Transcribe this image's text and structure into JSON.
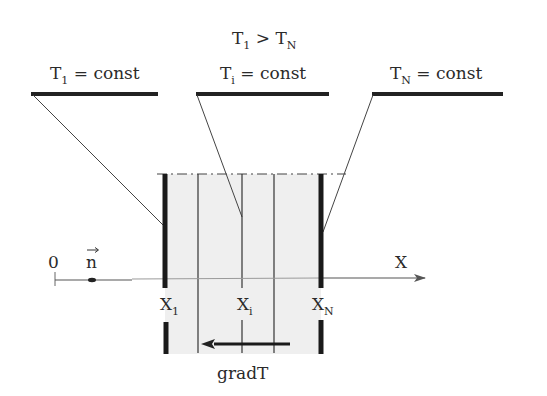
{
  "diagram": {
    "title": {
      "main": "T",
      "sub1": "1",
      "op": " > T",
      "sub2": "N"
    },
    "boundaries": [
      {
        "id": "first",
        "label_main": "T",
        "label_sub": "1",
        "label_rest": " = const"
      },
      {
        "id": "intermediate",
        "label_main": "T",
        "label_sub": "i",
        "label_rest": " = const"
      },
      {
        "id": "last",
        "label_main": "T",
        "label_sub": "N",
        "label_rest": " = const"
      }
    ],
    "axis": {
      "origin_label": "0",
      "normal_vector_label": "n",
      "axis_label": "X"
    },
    "positions": [
      {
        "main": "X",
        "sub": "1"
      },
      {
        "main": "X",
        "sub": "i"
      },
      {
        "main": "X",
        "sub": "N"
      }
    ],
    "gradient_label": "gradT",
    "colors": {
      "ink": "#2a2a2a",
      "region_fill": "#efefef",
      "axis_line": "#8a8a8a",
      "background": "#ffffff"
    }
  }
}
